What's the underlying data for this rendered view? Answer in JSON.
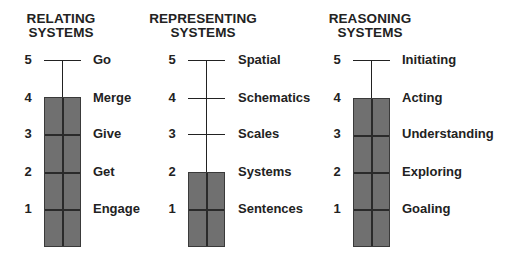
{
  "columns": [
    {
      "id": "relating",
      "title_line1": "RELATING",
      "title_line2": "SYSTEMS",
      "level": 4,
      "levels": [
        {
          "number": "5",
          "label": "Go"
        },
        {
          "number": "4",
          "label": "Merge"
        },
        {
          "number": "3",
          "label": "Give"
        },
        {
          "number": "2",
          "label": "Get"
        },
        {
          "number": "1",
          "label": "Engage"
        }
      ]
    },
    {
      "id": "representing",
      "title_line1": "REPRESENTING",
      "title_line2": "SYSTEMS",
      "level": 2,
      "levels": [
        {
          "number": "5",
          "label": "Spatial"
        },
        {
          "number": "4",
          "label": "Schematics"
        },
        {
          "number": "3",
          "label": "Scales"
        },
        {
          "number": "2",
          "label": "Systems"
        },
        {
          "number": "1",
          "label": "Sentences"
        }
      ]
    },
    {
      "id": "reasoning",
      "title_line1": "REASONING",
      "title_line2": "SYSTEMS",
      "level": 4,
      "levels": [
        {
          "number": "5",
          "label": "Initiating"
        },
        {
          "number": "4",
          "label": "Acting"
        },
        {
          "number": "3",
          "label": "Understanding"
        },
        {
          "number": "2",
          "label": "Exploring"
        },
        {
          "number": "1",
          "label": "Goaling"
        }
      ]
    }
  ],
  "colors": {
    "bar_fill": "#707070",
    "line": "#222222",
    "text": "#222222"
  }
}
